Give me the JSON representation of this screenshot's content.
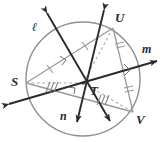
{
  "figure": {
    "kind": "circle-geometry-diagram",
    "colors": {
      "circle": "#8f8f8f",
      "chord": "#9a9a9a",
      "line": "#2b2b2b",
      "dashed": "#b0a8a8",
      "label": "#2b2b2b",
      "background": "#ffffff"
    },
    "circle": {
      "cx": 83,
      "cy": 79,
      "r": 57
    },
    "points": [
      {
        "name": "S",
        "x": 26,
        "y": 83,
        "label": "S",
        "label_x": 11,
        "label_y": 75
      },
      {
        "name": "T",
        "x": 83,
        "y": 83,
        "label": "T",
        "label_x": 90,
        "label_y": 84
      },
      {
        "name": "U",
        "x": 113,
        "y": 28,
        "label": "U",
        "label_x": 115,
        "label_y": 12
      },
      {
        "name": "V",
        "x": 133,
        "y": 112,
        "label": "V",
        "label_x": 136,
        "label_y": 114
      }
    ],
    "lines": [
      {
        "name": "l",
        "label": "ℓ",
        "label_x": 33,
        "label_y": 22
      },
      {
        "name": "m",
        "label": "m",
        "label_x": 143,
        "label_y": 44
      },
      {
        "name": "n",
        "label": "n",
        "label_x": 61,
        "label_y": 110
      }
    ],
    "tick_marks": [
      {
        "on": "S-U segment",
        "count": 1
      },
      {
        "on": "U-mid-right segment",
        "count": 2
      },
      {
        "on": "V-mid-right segment",
        "count": 2
      },
      {
        "on": "S-T dashed segment",
        "count": 3
      },
      {
        "on": "T-V dashed segment",
        "count": 3
      }
    ],
    "right_angle_marks": 3
  }
}
